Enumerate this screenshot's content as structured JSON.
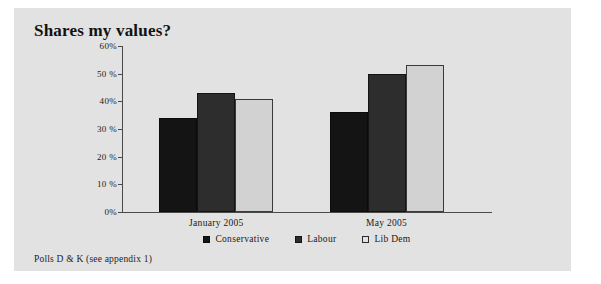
{
  "figure": {
    "title": "Shares my values?",
    "source_note": "Polls D & K (see appendix 1)",
    "background_color": "#e2e2e2",
    "page_color": "#ffffff"
  },
  "chart_data": {
    "type": "bar",
    "title": "Shares my values?",
    "xlabel": "",
    "ylabel": "",
    "categories": [
      "January 2005",
      "May 2005"
    ],
    "series": [
      {
        "name": "Conservative",
        "color": "#141414",
        "values": [
          34,
          36
        ]
      },
      {
        "name": "Labour",
        "color": "#2d2d2d",
        "values": [
          43,
          50
        ]
      },
      {
        "name": "Lib Dem",
        "color": "#d2d2d2",
        "values": [
          41,
          53
        ]
      }
    ],
    "ylim": [
      0,
      60
    ],
    "ytick_values": [
      0,
      10,
      20,
      30,
      40,
      50,
      60
    ],
    "ytick_labels": [
      "0%",
      "10 %",
      "20 %",
      "30 %",
      "40%",
      "50 %",
      "60%"
    ],
    "grid": false,
    "legend_position": "bottom",
    "annotations": [
      "Polls D & K (see appendix 1)"
    ]
  },
  "axis": {
    "ticks": [
      {
        "label": "60%",
        "value": 60
      },
      {
        "label": "50 %",
        "value": 50
      },
      {
        "label": "40%",
        "value": 40
      },
      {
        "label": "30 %",
        "value": 30
      },
      {
        "label": "20 %",
        "value": 20
      },
      {
        "label": "10 %",
        "value": 10
      },
      {
        "label": "0%",
        "value": 0
      }
    ]
  },
  "legend": {
    "items": [
      {
        "label": "Conservative",
        "swatch": "filled-black-square"
      },
      {
        "label": "Labour",
        "swatch": "filled-darkgray-square"
      },
      {
        "label": "Lib Dem",
        "swatch": "open-square"
      }
    ]
  }
}
